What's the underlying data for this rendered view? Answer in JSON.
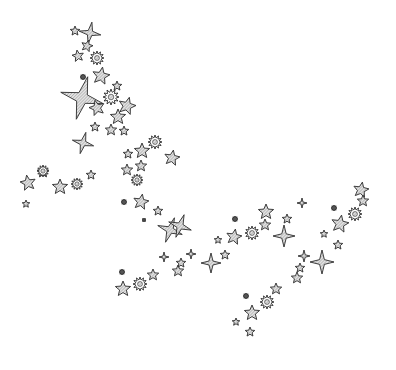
{
  "scene": {
    "title": "",
    "description": "Scattered hand-drawn star clip-art on white background",
    "width": 396,
    "height": 370,
    "colors": {
      "background": "#ffffff",
      "outline": "#2a2a2a",
      "fill": "#d0d0d0",
      "hatch": "#8a8a8a"
    }
  },
  "stars": [
    {
      "type": "star5",
      "x": 75,
      "y": 31,
      "r": 5,
      "rot": 0
    },
    {
      "type": "star4",
      "x": 90,
      "y": 33,
      "r": 11,
      "rot": 10
    },
    {
      "type": "star5",
      "x": 87,
      "y": 46,
      "r": 6,
      "rot": 15
    },
    {
      "type": "star5",
      "x": 78,
      "y": 56,
      "r": 6,
      "rot": -10
    },
    {
      "type": "burst",
      "x": 97,
      "y": 58,
      "r": 7,
      "rot": 0
    },
    {
      "type": "dot",
      "x": 83,
      "y": 77,
      "r": 3,
      "rot": 0
    },
    {
      "type": "star5",
      "x": 101,
      "y": 76,
      "r": 9,
      "rot": 10
    },
    {
      "type": "star4",
      "x": 82,
      "y": 98,
      "r": 22,
      "rot": 15
    },
    {
      "type": "star5",
      "x": 117,
      "y": 86,
      "r": 5,
      "rot": 0
    },
    {
      "type": "burst",
      "x": 111,
      "y": 97,
      "r": 8,
      "rot": 0
    },
    {
      "type": "star5",
      "x": 97,
      "y": 108,
      "r": 8,
      "rot": -15
    },
    {
      "type": "star5",
      "x": 127,
      "y": 106,
      "r": 9,
      "rot": 15
    },
    {
      "type": "star5",
      "x": 118,
      "y": 117,
      "r": 8,
      "rot": 0
    },
    {
      "type": "star5",
      "x": 95,
      "y": 127,
      "r": 5,
      "rot": 0
    },
    {
      "type": "star5",
      "x": 111,
      "y": 130,
      "r": 6,
      "rot": 0
    },
    {
      "type": "star5",
      "x": 124,
      "y": 131,
      "r": 5,
      "rot": 0
    },
    {
      "type": "star4",
      "x": 83,
      "y": 143,
      "r": 11,
      "rot": 15
    },
    {
      "type": "burst",
      "x": 155,
      "y": 142,
      "r": 7,
      "rot": 0
    },
    {
      "type": "star5",
      "x": 142,
      "y": 151,
      "r": 8,
      "rot": 0
    },
    {
      "type": "star5",
      "x": 128,
      "y": 154,
      "r": 5,
      "rot": 0
    },
    {
      "type": "star5",
      "x": 172,
      "y": 158,
      "r": 8,
      "rot": 10
    },
    {
      "type": "star5",
      "x": 141,
      "y": 166,
      "r": 6,
      "rot": 0
    },
    {
      "type": "star5",
      "x": 127,
      "y": 170,
      "r": 6,
      "rot": 0
    },
    {
      "type": "burst",
      "x": 137,
      "y": 180,
      "r": 6,
      "rot": 0
    },
    {
      "type": "star5",
      "x": 43,
      "y": 172,
      "r": 6,
      "rot": 0
    },
    {
      "type": "burst",
      "x": 43,
      "y": 171,
      "r": 6,
      "rot": 0
    },
    {
      "type": "star5",
      "x": 28,
      "y": 183,
      "r": 8,
      "rot": -10
    },
    {
      "type": "star5",
      "x": 60,
      "y": 187,
      "r": 8,
      "rot": 0
    },
    {
      "type": "burst",
      "x": 77,
      "y": 184,
      "r": 6,
      "rot": 0
    },
    {
      "type": "star5",
      "x": 91,
      "y": 175,
      "r": 5,
      "rot": 0
    },
    {
      "type": "star5",
      "x": 26,
      "y": 204,
      "r": 4,
      "rot": 0
    },
    {
      "type": "dot",
      "x": 124,
      "y": 202,
      "r": 3,
      "rot": 0
    },
    {
      "type": "star5",
      "x": 141,
      "y": 202,
      "r": 8,
      "rot": 10
    },
    {
      "type": "star5",
      "x": 158,
      "y": 211,
      "r": 5,
      "rot": 0
    },
    {
      "type": "dot",
      "x": 144,
      "y": 220,
      "r": 2,
      "rot": 0
    },
    {
      "type": "star4",
      "x": 170,
      "y": 230,
      "r": 13,
      "rot": 20
    },
    {
      "type": "star4",
      "x": 180,
      "y": 226,
      "r": 12,
      "rot": 20
    },
    {
      "type": "star4",
      "x": 164,
      "y": 257,
      "r": 5,
      "rot": 0
    },
    {
      "type": "star5",
      "x": 178,
      "y": 271,
      "r": 6,
      "rot": 0
    },
    {
      "type": "star4",
      "x": 191,
      "y": 254,
      "r": 5,
      "rot": 0
    },
    {
      "type": "star5",
      "x": 181,
      "y": 263,
      "r": 5,
      "rot": 0
    },
    {
      "type": "star4",
      "x": 211,
      "y": 263,
      "r": 10,
      "rot": 0
    },
    {
      "type": "dot",
      "x": 122,
      "y": 272,
      "r": 3,
      "rot": 0
    },
    {
      "type": "star5",
      "x": 123,
      "y": 289,
      "r": 8,
      "rot": 0
    },
    {
      "type": "burst",
      "x": 140,
      "y": 284,
      "r": 7,
      "rot": 0
    },
    {
      "type": "star5",
      "x": 153,
      "y": 275,
      "r": 6,
      "rot": 0
    },
    {
      "type": "dot",
      "x": 235,
      "y": 219,
      "r": 3,
      "rot": 0
    },
    {
      "type": "star5",
      "x": 234,
      "y": 237,
      "r": 8,
      "rot": 10
    },
    {
      "type": "star5",
      "x": 218,
      "y": 240,
      "r": 4,
      "rot": 0
    },
    {
      "type": "burst",
      "x": 252,
      "y": 233,
      "r": 7,
      "rot": 0
    },
    {
      "type": "star5",
      "x": 266,
      "y": 212,
      "r": 8,
      "rot": 0
    },
    {
      "type": "star5",
      "x": 265,
      "y": 225,
      "r": 6,
      "rot": 0
    },
    {
      "type": "star4",
      "x": 284,
      "y": 236,
      "r": 11,
      "rot": 0
    },
    {
      "type": "star5",
      "x": 287,
      "y": 219,
      "r": 5,
      "rot": 0
    },
    {
      "type": "star5",
      "x": 225,
      "y": 255,
      "r": 5,
      "rot": 0
    },
    {
      "type": "star4",
      "x": 302,
      "y": 203,
      "r": 5,
      "rot": 0
    },
    {
      "type": "star5",
      "x": 361,
      "y": 190,
      "r": 8,
      "rot": 10
    },
    {
      "type": "star5",
      "x": 363,
      "y": 201,
      "r": 6,
      "rot": 0
    },
    {
      "type": "dot",
      "x": 334,
      "y": 208,
      "r": 3,
      "rot": 0
    },
    {
      "type": "burst",
      "x": 355,
      "y": 214,
      "r": 7,
      "rot": 0
    },
    {
      "type": "star5",
      "x": 340,
      "y": 224,
      "r": 9,
      "rot": 10
    },
    {
      "type": "star5",
      "x": 324,
      "y": 234,
      "r": 4,
      "rot": 0
    },
    {
      "type": "star5",
      "x": 338,
      "y": 245,
      "r": 5,
      "rot": 0
    },
    {
      "type": "star4",
      "x": 304,
      "y": 256,
      "r": 6,
      "rot": 0
    },
    {
      "type": "star4",
      "x": 322,
      "y": 262,
      "r": 12,
      "rot": 0
    },
    {
      "type": "star5",
      "x": 300,
      "y": 268,
      "r": 5,
      "rot": 0
    },
    {
      "type": "star5",
      "x": 297,
      "y": 278,
      "r": 6,
      "rot": 0
    },
    {
      "type": "star5",
      "x": 276,
      "y": 289,
      "r": 6,
      "rot": 0
    },
    {
      "type": "dot",
      "x": 246,
      "y": 296,
      "r": 3,
      "rot": 0
    },
    {
      "type": "burst",
      "x": 267,
      "y": 302,
      "r": 7,
      "rot": 0
    },
    {
      "type": "star5",
      "x": 252,
      "y": 313,
      "r": 8,
      "rot": 0
    },
    {
      "type": "star5",
      "x": 236,
      "y": 322,
      "r": 4,
      "rot": 0
    },
    {
      "type": "star5",
      "x": 250,
      "y": 332,
      "r": 5,
      "rot": 0
    }
  ]
}
